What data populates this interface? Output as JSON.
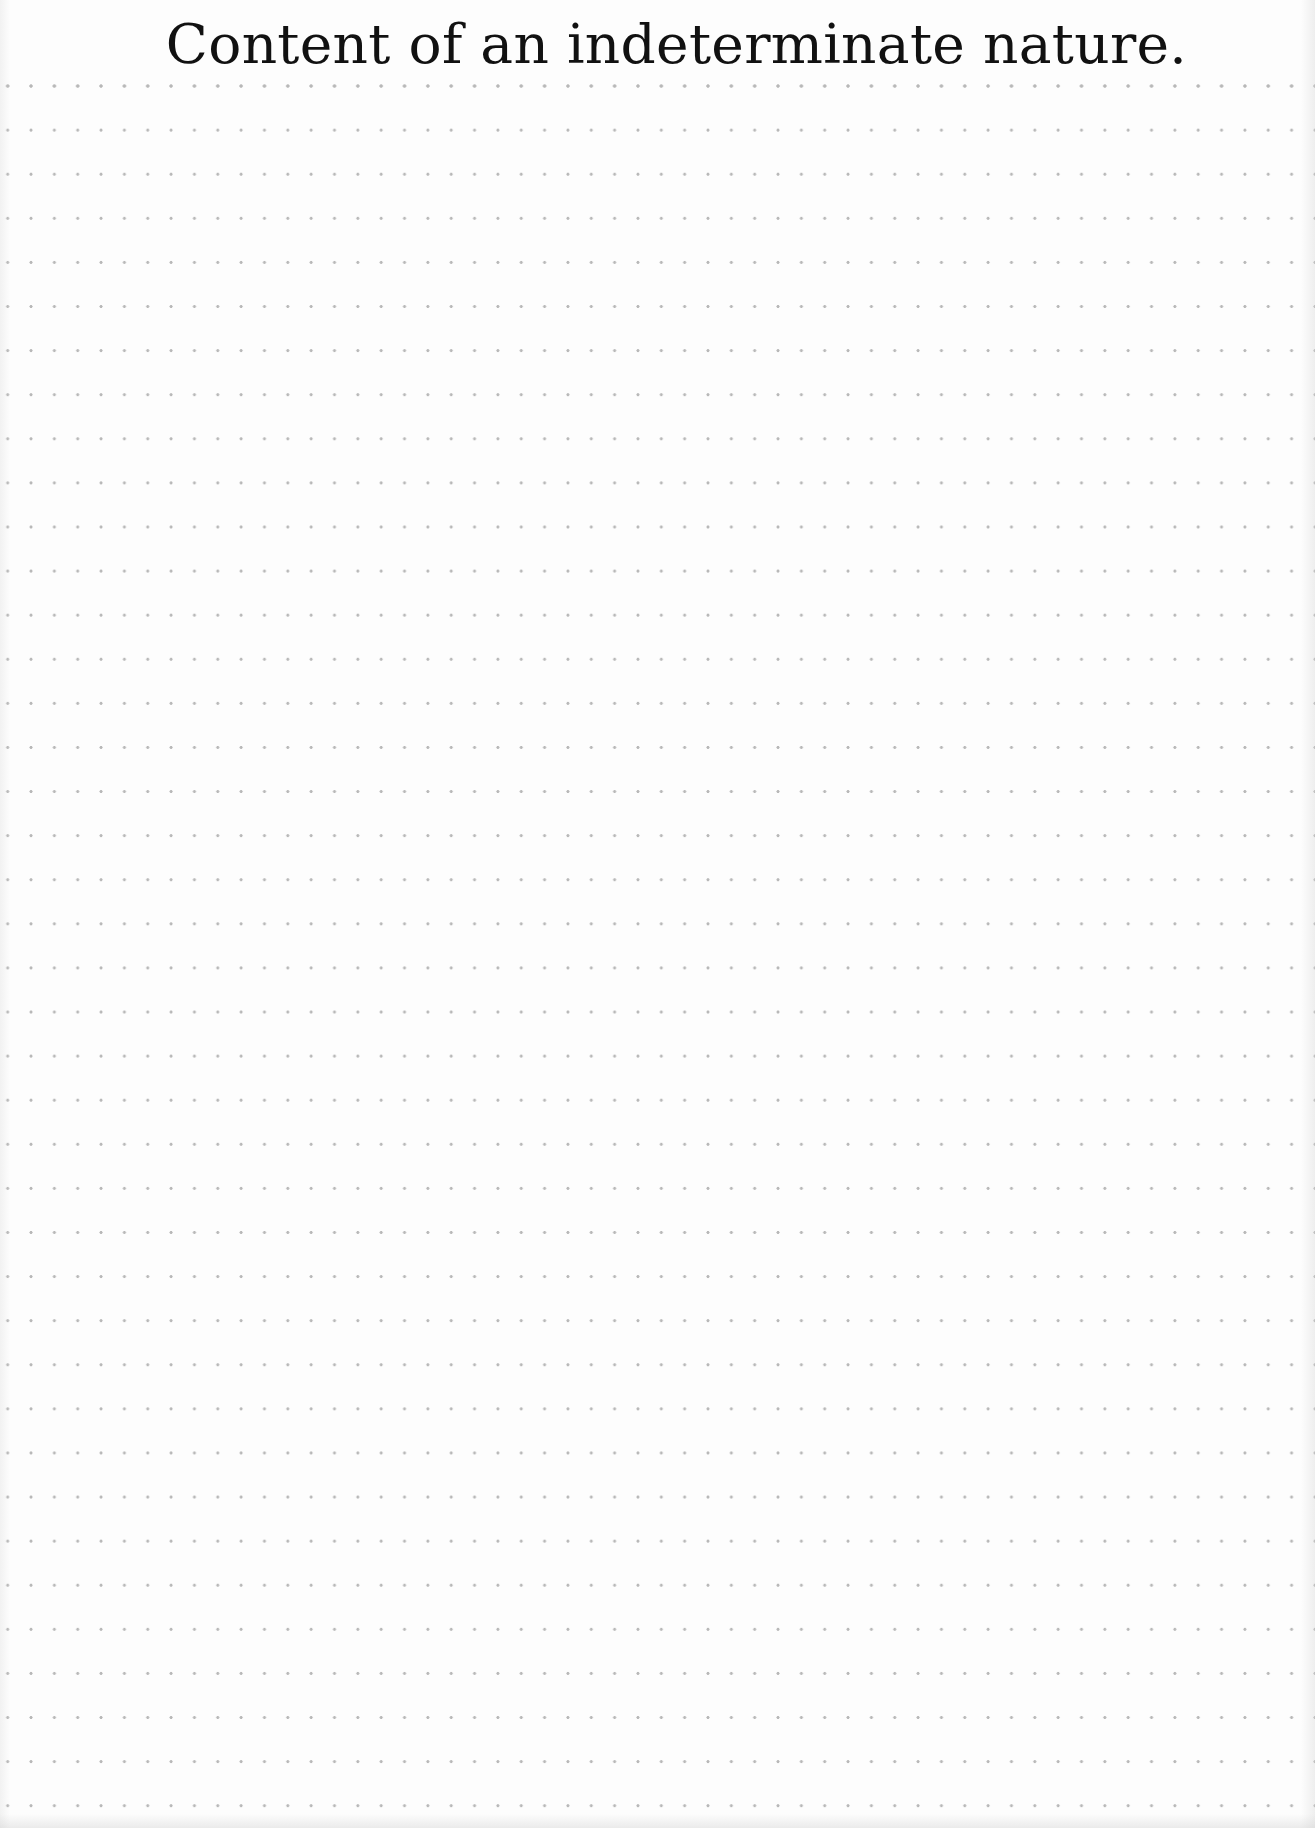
{
  "page": {
    "title": "Content of an indeterminate nature.",
    "background": "dot-grid",
    "colors": {
      "paper": "#fdfdfd",
      "dots": "#b8b8b8",
      "text": "#111111"
    },
    "grid": {
      "dot_spacing_x_px": 23.35,
      "dot_spacing_y_px": 44.1,
      "rows": 40,
      "columns": 56
    }
  }
}
